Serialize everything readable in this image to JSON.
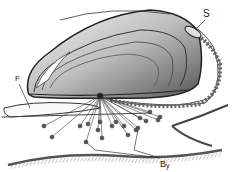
{
  "figure": {
    "labels": [
      {
        "id": "S",
        "text": "S"
      },
      {
        "id": "F",
        "text": "F"
      },
      {
        "id": "By",
        "text": "B",
        "sub": "y"
      }
    ],
    "colors": {
      "ink": "#2a2a2a",
      "paper": "#ffffff",
      "shade": "#6a6a6a"
    }
  }
}
